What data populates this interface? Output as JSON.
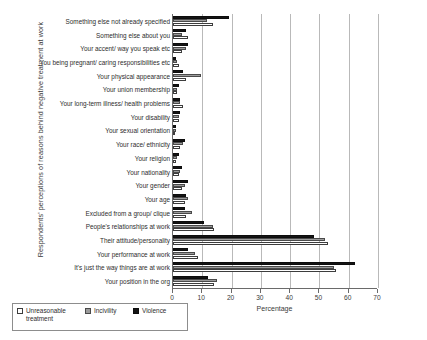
{
  "chart_data": {
    "type": "bar",
    "orientation": "horizontal",
    "title": "",
    "xlabel": "Percentage",
    "ylabel": "Respondents' perceptions of reasons behind negative treatment at work",
    "xlim": [
      0,
      70
    ],
    "xticks": [
      0,
      10,
      20,
      30,
      40,
      50,
      60,
      70
    ],
    "grid": "vertical",
    "legend_position": "bottom-left",
    "categories": [
      "Something else not already specified",
      "Something else about you",
      "Your accent/ way you speak etc",
      "You being pregnant/ caring responsibilities etc",
      "Your physical appearance",
      "Your union membership",
      "Your long-term illness/ health problems",
      "Your disability",
      "Your sexual orientation",
      "Your race/ ethnicity",
      "Your religion",
      "Your nationality",
      "Your gender",
      "Your age",
      "Excluded from a group/ clique",
      "People's relationships at work",
      "Their attitude/personality",
      "Your performance at work",
      "It's just the way things are at work",
      "Your position in the org"
    ],
    "series": [
      {
        "name": "Violence",
        "color": "#141414",
        "values": [
          19.0,
          4.5,
          5.0,
          1.0,
          3.5,
          2.0,
          2.5,
          2.5,
          1.0,
          4.0,
          2.0,
          3.0,
          5.0,
          4.5,
          4.0,
          10.5,
          48.0,
          5.0,
          62.0,
          12.0
        ]
      },
      {
        "name": "Incivility",
        "color": "#9b9b9b",
        "values": [
          11.5,
          3.0,
          4.5,
          1.5,
          9.5,
          1.5,
          2.5,
          2.0,
          1.0,
          3.5,
          1.5,
          2.5,
          4.0,
          5.0,
          6.5,
          13.5,
          52.0,
          7.5,
          55.0,
          15.0
        ]
      },
      {
        "name": "Unreasonable treatment",
        "color": "#ffffff",
        "values": [
          13.5,
          5.0,
          3.0,
          2.0,
          4.5,
          1.5,
          3.5,
          2.0,
          0.8,
          2.5,
          1.0,
          2.0,
          3.0,
          4.0,
          4.5,
          14.0,
          53.0,
          8.5,
          55.5,
          14.0
        ]
      }
    ],
    "legend": [
      {
        "label": "Unreasonable treatment",
        "key": "unreasonable"
      },
      {
        "label": "Incivility",
        "key": "incivility"
      },
      {
        "label": "Violence",
        "key": "violence"
      }
    ]
  }
}
